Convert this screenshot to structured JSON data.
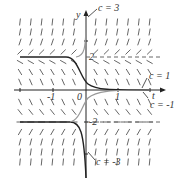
{
  "figure": {
    "axes": {
      "x_label": "t",
      "y_label": "y",
      "origin_label": "0",
      "x_tick_labels": [
        "-1",
        "1"
      ],
      "y_tick_labels": [
        "2",
        "-2"
      ]
    },
    "curve_labels": [
      "c = 3",
      "c = 1",
      "c = -1",
      "c = -3"
    ],
    "equilibria": [
      2,
      -2
    ]
  }
}
